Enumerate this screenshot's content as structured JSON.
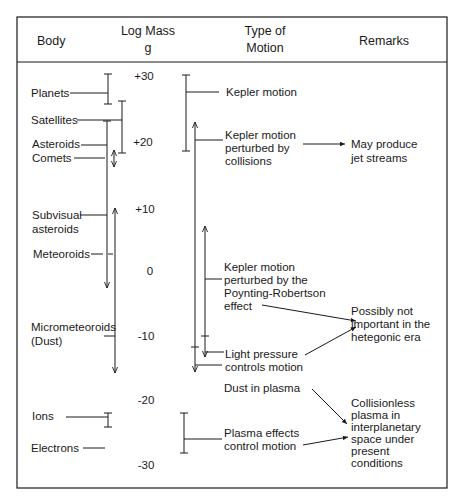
{
  "header": {
    "col_body": "Body",
    "col_mass_line1": "Log Mass",
    "col_mass_line2": "g",
    "col_motion_line1": "Type of",
    "col_motion_line2": "Motion",
    "col_remarks": "Remarks"
  },
  "mass_scale": [
    "+30",
    "+20",
    "+10",
    "0",
    "-10",
    "-20",
    "-30"
  ],
  "bodies": [
    {
      "lines": [
        "Planets"
      ],
      "log_mass_range": [
        24,
        30
      ]
    },
    {
      "lines": [
        "Satellites"
      ],
      "log_mass_range": [
        19,
        27
      ]
    },
    {
      "lines": [
        "Asteroids"
      ],
      "log_mass_range": [
        -2,
        23
      ]
    },
    {
      "lines": [
        "Comets"
      ],
      "log_mass_range": [
        17,
        20
      ]
    },
    {
      "lines": [
        "Subvisual",
        "asteroids"
      ],
      "log_mass_range": [
        -18,
        10
      ]
    },
    {
      "lines": [
        "Meteoroids"
      ],
      "log_mass_range": [
        -10,
        10
      ]
    },
    {
      "lines": [
        "Micrometeoroids",
        "(Dust)"
      ],
      "log_mass_range": [
        -18,
        -10
      ]
    },
    {
      "lines": [
        "Ions"
      ],
      "log_mass_range": [
        -23,
        -21
      ]
    },
    {
      "lines": [
        "Electrons"
      ],
      "log_mass_range": [
        -27,
        -27
      ]
    }
  ],
  "motions": [
    {
      "lines": [
        "Kepler motion"
      ]
    },
    {
      "lines": [
        "Kepler motion",
        "perturbed by",
        "collisions"
      ]
    },
    {
      "lines": [
        "Kepler motion",
        "perturbed by the",
        "Poynting-Robertson",
        "effect"
      ]
    },
    {
      "lines": [
        "Light pressure",
        "controls motion"
      ]
    },
    {
      "lines": [
        "Dust in plasma"
      ]
    },
    {
      "lines": [
        "Plasma effects",
        "control motion"
      ]
    }
  ],
  "remarks": [
    {
      "lines": [
        "May produce",
        "jet streams"
      ]
    },
    {
      "lines": [
        "Possibly not",
        "important in the",
        "hetegonic era"
      ]
    },
    {
      "lines": [
        "Collisionless",
        "plasma in",
        "interplanetary",
        "space under",
        "present",
        "conditions"
      ]
    }
  ]
}
